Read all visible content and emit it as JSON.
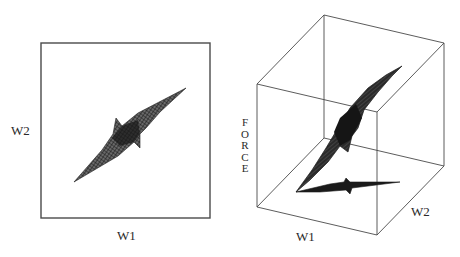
{
  "figure": {
    "panels": [
      {
        "id": "top-view",
        "type": "2d-projection",
        "x_label": "W1",
        "y_label": "W2"
      },
      {
        "id": "perspective-view",
        "type": "3d-surface",
        "x_label": "W1",
        "y_label": "W2",
        "z_label": "FORCE"
      }
    ],
    "colors": {
      "frame": "#4a4a4a",
      "surface": "#1e1e1e",
      "background": "#ffffff"
    }
  }
}
